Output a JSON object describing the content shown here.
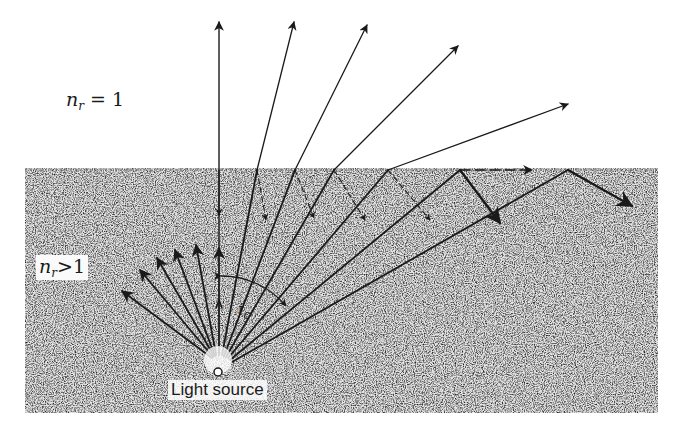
{
  "diagram": {
    "labels": {
      "air_medium": {
        "n": "n",
        "sub": "r",
        "rel": "=",
        "value": "1"
      },
      "dense_medium": {
        "n": "n",
        "sub": "r",
        "rel": ">",
        "value": "1"
      },
      "critical_angle": {
        "i": "i",
        "sub": "c"
      },
      "source": "Light source"
    },
    "colors": {
      "ink": "#1a1a1a",
      "medium_fill": "#d9d9d9",
      "background": "#ffffff"
    },
    "geometry": {
      "source": [
        218,
        372
      ],
      "surface_y": 170,
      "medium_rect": [
        25,
        168,
        658,
        413
      ]
    }
  }
}
